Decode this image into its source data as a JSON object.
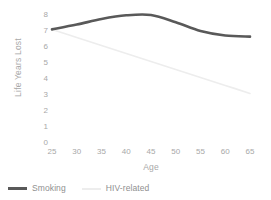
{
  "chart_data": {
    "type": "line",
    "title": "",
    "xlabel": "Age",
    "ylabel": "Life Years Lost",
    "xlim": [
      25,
      65
    ],
    "ylim": [
      0,
      8
    ],
    "xticks": [
      25,
      30,
      35,
      40,
      45,
      50,
      55,
      60,
      65
    ],
    "yticks": [
      0,
      1,
      2,
      3,
      4,
      5,
      6,
      7,
      8
    ],
    "grid": false,
    "legend_position": "bottom-left",
    "x": [
      25,
      30,
      35,
      40,
      45,
      50,
      55,
      60,
      65
    ],
    "series": [
      {
        "name": "Smoking",
        "color": "#595959",
        "linewidth": 2.6,
        "values": [
          7.1,
          7.4,
          7.75,
          7.98,
          8.0,
          7.55,
          7.0,
          6.72,
          6.65
        ]
      },
      {
        "name": "HIV-related",
        "color": "#ededed",
        "linewidth": 1.6,
        "values": [
          7.1,
          6.6,
          6.1,
          5.6,
          5.1,
          4.6,
          4.1,
          3.6,
          3.1
        ]
      }
    ]
  },
  "axes": {
    "y_title": "Life Years Lost",
    "x_title": "Age",
    "y_tick_labels": [
      "8",
      "7",
      "6",
      "5",
      "4",
      "3",
      "2",
      "1",
      "0"
    ],
    "x_tick_labels": [
      "25",
      "30",
      "35",
      "40",
      "45",
      "50",
      "55",
      "60",
      "65"
    ]
  },
  "legend": {
    "items": [
      {
        "label": "Smoking",
        "color": "#595959"
      },
      {
        "label": "HIV-related",
        "color": "#ededed"
      }
    ]
  },
  "colors": {
    "background": "#ffffff",
    "text": "#a8a8a8",
    "legend_text": "#8f8f8f",
    "smoking": "#595959",
    "hiv": "#ededed"
  }
}
